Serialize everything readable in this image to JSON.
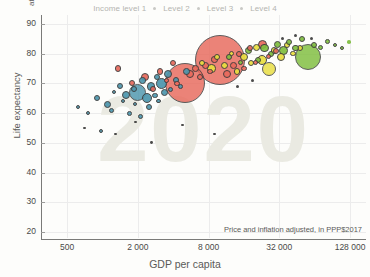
{
  "legend": {
    "items": [
      {
        "label": "Income level 1"
      },
      {
        "label": "Level 2"
      },
      {
        "label": "Level 3"
      },
      {
        "label": "Level 4"
      }
    ]
  },
  "axes": {
    "y_title": "Life expectancy",
    "y_unit": "at birth",
    "x_title": "GDP per capita",
    "x_note": "Price and inflation adjusted, in PPP$2017"
  },
  "watermark": "2020",
  "chart_data": {
    "type": "scatter",
    "title": "",
    "xlabel": "GDP per capita",
    "ylabel": "Life expectancy",
    "xscale": "log",
    "xlim": [
      300,
      175000
    ],
    "ylim": [
      18,
      93
    ],
    "xticks": [
      500,
      2000,
      8000,
      32000,
      128000
    ],
    "xticklabels": [
      "500",
      "2 000",
      "8 000",
      "32 000",
      "128 000"
    ],
    "yticks": [
      20,
      30,
      40,
      50,
      60,
      70,
      80,
      90
    ],
    "yticklabels": [
      "20",
      "30",
      "40",
      "50",
      "60",
      "70",
      "80",
      "90"
    ],
    "grid": true,
    "legend_position": "top-center",
    "annotation": "Price and inflation adjusted, in PPP$2017",
    "size_encodes": "population",
    "color_encodes": "income level / world region",
    "colors": {
      "level1_blue": "#4d96ad",
      "level2_red": "#e8695c",
      "level3_yellow": "#e9de3f",
      "level4_green": "#7fbe3e",
      "outline": "#3b3b3b",
      "grid": "#ececec",
      "axis": "#7a7a78",
      "watermark": "#eaeae2",
      "legend_text": "#b4b4b0",
      "label_text": "#5a5a58"
    },
    "points": [
      {
        "x": 620,
        "y": 62,
        "r": 2.0,
        "c": "#4d96ad"
      },
      {
        "x": 760,
        "y": 60,
        "r": 2.0,
        "c": "#4d96ad"
      },
      {
        "x": 900,
        "y": 65,
        "r": 3.0,
        "c": "#4d96ad"
      },
      {
        "x": 980,
        "y": 54,
        "r": 2.0,
        "c": "#4d96ad"
      },
      {
        "x": 1100,
        "y": 63,
        "r": 3.5,
        "c": "#4d96ad"
      },
      {
        "x": 1200,
        "y": 61,
        "r": 2.5,
        "c": "#4d96ad"
      },
      {
        "x": 1250,
        "y": 67,
        "r": 2.0,
        "c": "#4d96ad"
      },
      {
        "x": 1400,
        "y": 69,
        "r": 3.0,
        "c": "#4d96ad"
      },
      {
        "x": 1500,
        "y": 64,
        "r": 2.2,
        "c": "#4d96ad"
      },
      {
        "x": 1600,
        "y": 66,
        "r": 4.0,
        "c": "#4d96ad"
      },
      {
        "x": 1700,
        "y": 60,
        "r": 2.4,
        "c": "#4d96ad"
      },
      {
        "x": 1850,
        "y": 68,
        "r": 3.0,
        "c": "#4d96ad"
      },
      {
        "x": 1900,
        "y": 63,
        "r": 2.0,
        "c": "#4d96ad"
      },
      {
        "x": 2000,
        "y": 67,
        "r": 8.5,
        "c": "#4d96ad"
      },
      {
        "x": 2100,
        "y": 59,
        "r": 2.5,
        "c": "#4d96ad"
      },
      {
        "x": 2200,
        "y": 71,
        "r": 3.2,
        "c": "#4d96ad"
      },
      {
        "x": 2400,
        "y": 65,
        "r": 5.0,
        "c": "#4d96ad"
      },
      {
        "x": 2500,
        "y": 62,
        "r": 3.0,
        "c": "#4d96ad"
      },
      {
        "x": 2600,
        "y": 69,
        "r": 4.2,
        "c": "#4d96ad"
      },
      {
        "x": 2800,
        "y": 66,
        "r": 2.6,
        "c": "#4d96ad"
      },
      {
        "x": 2900,
        "y": 72,
        "r": 3.0,
        "c": "#4d96ad"
      },
      {
        "x": 3000,
        "y": 64,
        "r": 2.2,
        "c": "#4d96ad"
      },
      {
        "x": 3200,
        "y": 70,
        "r": 5.5,
        "c": "#4d96ad"
      },
      {
        "x": 3400,
        "y": 67,
        "r": 3.6,
        "c": "#4d96ad"
      },
      {
        "x": 3600,
        "y": 73,
        "r": 4.0,
        "c": "#4d96ad"
      },
      {
        "x": 3800,
        "y": 68,
        "r": 2.8,
        "c": "#4d96ad"
      },
      {
        "x": 4200,
        "y": 71,
        "r": 3.0,
        "c": "#4d96ad"
      },
      {
        "x": 4600,
        "y": 69,
        "r": 2.4,
        "c": "#4d96ad"
      },
      {
        "x": 5200,
        "y": 74,
        "r": 3.4,
        "c": "#4d96ad"
      },
      {
        "x": 1350,
        "y": 75,
        "r": 3.2,
        "c": "#e8695c"
      },
      {
        "x": 1800,
        "y": 70,
        "r": 3.0,
        "c": "#e8695c"
      },
      {
        "x": 2300,
        "y": 72,
        "r": 4.0,
        "c": "#e8695c"
      },
      {
        "x": 2700,
        "y": 68,
        "r": 3.0,
        "c": "#e8695c"
      },
      {
        "x": 3100,
        "y": 74,
        "r": 3.2,
        "c": "#e8695c"
      },
      {
        "x": 3500,
        "y": 71,
        "r": 2.6,
        "c": "#e8695c"
      },
      {
        "x": 4000,
        "y": 77,
        "r": 3.0,
        "c": "#e8695c"
      },
      {
        "x": 4300,
        "y": 70,
        "r": 2.8,
        "c": "#e8695c"
      },
      {
        "x": 5000,
        "y": 70,
        "r": 20.0,
        "c": "#e8695c"
      },
      {
        "x": 5600,
        "y": 73,
        "r": 4.0,
        "c": "#e8695c"
      },
      {
        "x": 6200,
        "y": 75,
        "r": 3.4,
        "c": "#e8695c"
      },
      {
        "x": 6800,
        "y": 72,
        "r": 3.0,
        "c": "#e8695c"
      },
      {
        "x": 7500,
        "y": 76,
        "r": 3.6,
        "c": "#e8695c"
      },
      {
        "x": 8200,
        "y": 74,
        "r": 2.8,
        "c": "#e8695c"
      },
      {
        "x": 9000,
        "y": 78,
        "r": 3.2,
        "c": "#e8695c"
      },
      {
        "x": 10000,
        "y": 78,
        "r": 25.0,
        "c": "#e8695c"
      },
      {
        "x": 11500,
        "y": 73,
        "r": 4.0,
        "c": "#e8695c"
      },
      {
        "x": 13000,
        "y": 76,
        "r": 3.4,
        "c": "#e8695c"
      },
      {
        "x": 14500,
        "y": 80,
        "r": 3.0,
        "c": "#e8695c"
      },
      {
        "x": 16000,
        "y": 75,
        "r": 2.6,
        "c": "#e8695c"
      },
      {
        "x": 18000,
        "y": 82,
        "r": 3.0,
        "c": "#e8695c"
      },
      {
        "x": 20000,
        "y": 77,
        "r": 2.8,
        "c": "#e8695c"
      },
      {
        "x": 23000,
        "y": 83,
        "r": 4.6,
        "c": "#e8695c"
      },
      {
        "x": 26000,
        "y": 79,
        "r": 2.6,
        "c": "#e8695c"
      },
      {
        "x": 30000,
        "y": 81,
        "r": 3.0,
        "c": "#e8695c"
      },
      {
        "x": 7000,
        "y": 77,
        "r": 3.0,
        "c": "#e9de3f"
      },
      {
        "x": 8500,
        "y": 75,
        "r": 4.2,
        "c": "#e9de3f"
      },
      {
        "x": 9500,
        "y": 79,
        "r": 3.0,
        "c": "#e9de3f"
      },
      {
        "x": 11000,
        "y": 76,
        "r": 3.6,
        "c": "#e9de3f"
      },
      {
        "x": 12500,
        "y": 80,
        "r": 2.8,
        "c": "#e9de3f"
      },
      {
        "x": 14000,
        "y": 74,
        "r": 3.2,
        "c": "#e9de3f"
      },
      {
        "x": 16000,
        "y": 79,
        "r": 4.0,
        "c": "#e9de3f"
      },
      {
        "x": 18500,
        "y": 77,
        "r": 3.0,
        "c": "#e9de3f"
      },
      {
        "x": 20500,
        "y": 82,
        "r": 3.4,
        "c": "#e9de3f"
      },
      {
        "x": 23000,
        "y": 78,
        "r": 5.0,
        "c": "#e9de3f"
      },
      {
        "x": 26000,
        "y": 75,
        "r": 7.0,
        "c": "#e9de3f"
      },
      {
        "x": 29000,
        "y": 81,
        "r": 3.2,
        "c": "#e9de3f"
      },
      {
        "x": 33000,
        "y": 79,
        "r": 4.0,
        "c": "#e9de3f"
      },
      {
        "x": 37000,
        "y": 83,
        "r": 3.0,
        "c": "#e9de3f"
      },
      {
        "x": 42000,
        "y": 80,
        "r": 2.8,
        "c": "#e9de3f"
      },
      {
        "x": 48000,
        "y": 82,
        "r": 3.2,
        "c": "#e9de3f"
      },
      {
        "x": 12000,
        "y": 79,
        "r": 3.0,
        "c": "#7fbe3e"
      },
      {
        "x": 15000,
        "y": 77,
        "r": 2.6,
        "c": "#7fbe3e"
      },
      {
        "x": 17500,
        "y": 81,
        "r": 3.4,
        "c": "#7fbe3e"
      },
      {
        "x": 21000,
        "y": 78,
        "r": 3.0,
        "c": "#7fbe3e"
      },
      {
        "x": 24000,
        "y": 82,
        "r": 4.2,
        "c": "#7fbe3e"
      },
      {
        "x": 27000,
        "y": 80,
        "r": 3.0,
        "c": "#7fbe3e"
      },
      {
        "x": 31000,
        "y": 83,
        "r": 3.6,
        "c": "#7fbe3e"
      },
      {
        "x": 35000,
        "y": 81,
        "r": 4.4,
        "c": "#7fbe3e"
      },
      {
        "x": 39000,
        "y": 84,
        "r": 3.0,
        "c": "#7fbe3e"
      },
      {
        "x": 44000,
        "y": 82,
        "r": 3.2,
        "c": "#7fbe3e"
      },
      {
        "x": 50000,
        "y": 85,
        "r": 3.0,
        "c": "#7fbe3e"
      },
      {
        "x": 56000,
        "y": 79,
        "r": 13.0,
        "c": "#7fbe3e"
      },
      {
        "x": 63000,
        "y": 83,
        "r": 3.0,
        "c": "#7fbe3e"
      },
      {
        "x": 72000,
        "y": 82,
        "r": 2.6,
        "c": "#7fbe3e"
      },
      {
        "x": 82000,
        "y": 84,
        "r": 2.4,
        "c": "#7fbe3e"
      },
      {
        "x": 95000,
        "y": 83,
        "r": 2.2,
        "c": "#7fbe3e"
      },
      {
        "x": 110000,
        "y": 82,
        "r": 2.0,
        "c": "#7fbe3e"
      },
      {
        "x": 125000,
        "y": 84,
        "r": 1.8,
        "c": "#7fbe3e"
      },
      {
        "x": 700,
        "y": 55,
        "r": 1.4,
        "c": "#3d3d3d"
      },
      {
        "x": 1300,
        "y": 53,
        "r": 1.4,
        "c": "#3d3d3d"
      },
      {
        "x": 2600,
        "y": 50,
        "r": 1.4,
        "c": "#3d3d3d"
      },
      {
        "x": 4800,
        "y": 56,
        "r": 1.4,
        "c": "#3d3d3d"
      },
      {
        "x": 9000,
        "y": 53,
        "r": 1.4,
        "c": "#3d3d3d"
      },
      {
        "x": 1900,
        "y": 57,
        "r": 1.4,
        "c": "#3d3d3d"
      },
      {
        "x": 34000,
        "y": 85,
        "r": 1.6,
        "c": "#3d3d3d"
      },
      {
        "x": 44000,
        "y": 86,
        "r": 1.6,
        "c": "#3d3d3d"
      },
      {
        "x": 60000,
        "y": 85,
        "r": 1.6,
        "c": "#3d3d3d"
      },
      {
        "x": 14000,
        "y": 69,
        "r": 1.6,
        "c": "#3d3d3d"
      },
      {
        "x": 19000,
        "y": 71,
        "r": 1.6,
        "c": "#3d3d3d"
      }
    ]
  }
}
